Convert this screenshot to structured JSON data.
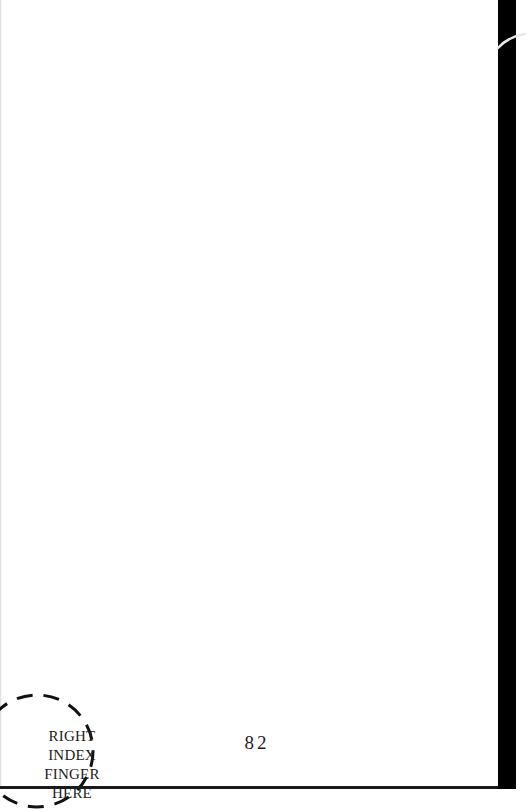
{
  "document": {
    "type": "scanned-booklet-page",
    "page_number": "82",
    "finger_guide": {
      "lines": [
        "RIGHT",
        "INDEX",
        "FINGER",
        "HERE"
      ],
      "shape": "dashed-circle"
    }
  },
  "colors": {
    "page": "#ffffff",
    "text": "#1c1c1c",
    "scan_border": "#000000"
  }
}
